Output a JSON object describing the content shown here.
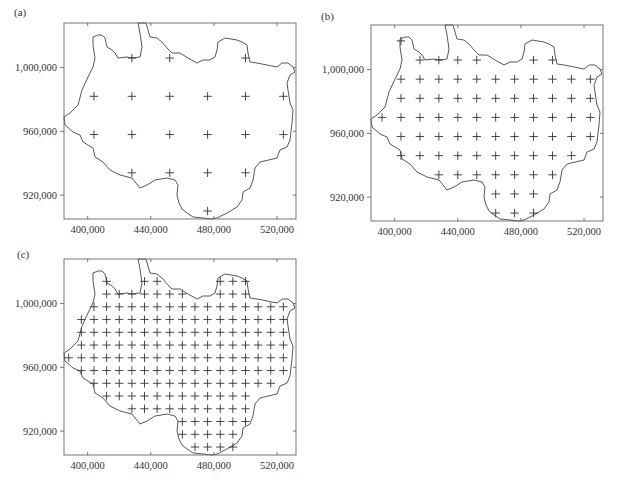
{
  "figure": {
    "panels": [
      {
        "id": "a",
        "label": "(a)"
      },
      {
        "id": "b",
        "label": "(b)"
      },
      {
        "id": "c",
        "label": "(c)"
      }
    ]
  },
  "chart_data": [
    {
      "type": "scatter",
      "title": "(a)",
      "xlabel": "",
      "ylabel": "",
      "xlim": [
        385000,
        532000
      ],
      "ylim": [
        905000,
        1028000
      ],
      "x_ticks": [
        400000,
        440000,
        480000,
        520000
      ],
      "x_tick_labels": [
        "400,000",
        "440,000",
        "480,000",
        "520,000"
      ],
      "y_ticks": [
        920000,
        960000,
        1000000
      ],
      "y_tick_labels": [
        "920,000",
        "960,000",
        "1,000,000"
      ],
      "grid": false,
      "marker": "+",
      "grid_spacing": 24000,
      "columns_x": [
        404000,
        428000,
        452000,
        476000,
        500000,
        524000
      ],
      "rows_y": [
        1006000,
        982000,
        958000,
        934000,
        910000
      ],
      "rows": [
        [
          1,
          2,
          4
        ],
        [
          0,
          1,
          2,
          3,
          4,
          5
        ],
        [
          0,
          1,
          2,
          3,
          4,
          5
        ],
        [
          1,
          2,
          3,
          4
        ],
        [
          3
        ]
      ],
      "point_count": 20
    },
    {
      "type": "scatter",
      "title": "(b)",
      "xlabel": "",
      "ylabel": "",
      "xlim": [
        385000,
        532000
      ],
      "ylim": [
        905000,
        1028000
      ],
      "x_ticks": [
        400000,
        440000,
        480000,
        520000
      ],
      "x_tick_labels": [
        "400,000",
        "440,000",
        "480,000",
        "520,000"
      ],
      "y_ticks": [
        920000,
        960000,
        1000000
      ],
      "y_tick_labels": [
        "920,000",
        "960,000",
        "1,000,000"
      ],
      "grid": false,
      "marker": "+",
      "grid_spacing": 12000,
      "columns_x": [
        392000,
        404000,
        416000,
        428000,
        440000,
        452000,
        464000,
        476000,
        488000,
        500000,
        512000,
        524000
      ],
      "rows_y": [
        1018000,
        1006000,
        994000,
        982000,
        970000,
        958000,
        946000,
        934000,
        922000,
        910000
      ],
      "rows": [
        [
          1
        ],
        [
          2,
          3,
          4,
          5,
          8,
          9
        ],
        [
          1,
          2,
          3,
          4,
          5,
          6,
          7,
          8,
          9,
          10,
          11
        ],
        [
          1,
          2,
          3,
          4,
          5,
          6,
          7,
          8,
          9,
          10,
          11
        ],
        [
          0,
          1,
          2,
          3,
          4,
          5,
          6,
          7,
          8,
          9,
          10,
          11
        ],
        [
          1,
          2,
          3,
          4,
          5,
          6,
          7,
          8,
          9,
          10,
          11
        ],
        [
          1,
          2,
          3,
          4,
          5,
          6,
          7,
          8,
          9,
          10
        ],
        [
          3,
          4,
          5,
          6,
          7,
          8,
          9
        ],
        [
          6,
          7,
          8
        ],
        [
          6,
          7,
          8
        ]
      ],
      "point_count": 83
    },
    {
      "type": "scatter",
      "title": "(c)",
      "xlabel": "",
      "ylabel": "",
      "xlim": [
        385000,
        532000
      ],
      "ylim": [
        905000,
        1028000
      ],
      "x_ticks": [
        400000,
        440000,
        480000,
        520000
      ],
      "x_tick_labels": [
        "400,000",
        "440,000",
        "480,000",
        "520,000"
      ],
      "y_ticks": [
        920000,
        960000,
        1000000
      ],
      "y_tick_labels": [
        "920,000",
        "960,000",
        "1,000,000"
      ],
      "grid": false,
      "marker": "+",
      "grid_spacing": 8000,
      "columns_x": [
        388000,
        396000,
        404000,
        412000,
        420000,
        428000,
        436000,
        444000,
        452000,
        460000,
        468000,
        476000,
        484000,
        492000,
        500000,
        508000,
        516000,
        524000
      ],
      "rows_y": [
        1014000,
        1006000,
        998000,
        990000,
        982000,
        974000,
        966000,
        958000,
        950000,
        942000,
        934000,
        926000,
        918000,
        910000
      ],
      "rows": [
        [
          3,
          6,
          7,
          12,
          13,
          14
        ],
        [
          3,
          4,
          5,
          6,
          7,
          8,
          9,
          12,
          13,
          14
        ],
        [
          2,
          3,
          4,
          5,
          6,
          7,
          8,
          9,
          10,
          11,
          12,
          13,
          14,
          15,
          16,
          17
        ],
        [
          1,
          2,
          3,
          4,
          5,
          6,
          7,
          8,
          9,
          10,
          11,
          12,
          13,
          14,
          15,
          16,
          17
        ],
        [
          1,
          2,
          3,
          4,
          5,
          6,
          7,
          8,
          9,
          10,
          11,
          12,
          13,
          14,
          15,
          16,
          17
        ],
        [
          1,
          2,
          3,
          4,
          5,
          6,
          7,
          8,
          9,
          10,
          11,
          12,
          13,
          14,
          15,
          16,
          17
        ],
        [
          0,
          1,
          2,
          3,
          4,
          5,
          6,
          7,
          8,
          9,
          10,
          11,
          12,
          13,
          14,
          15,
          16,
          17
        ],
        [
          1,
          2,
          3,
          4,
          5,
          6,
          7,
          8,
          9,
          10,
          11,
          12,
          13,
          14,
          15,
          16,
          17
        ],
        [
          2,
          3,
          4,
          5,
          6,
          7,
          8,
          9,
          10,
          11,
          12,
          13,
          14,
          15,
          16
        ],
        [
          3,
          4,
          5,
          6,
          7,
          8,
          9,
          10,
          11,
          12,
          13,
          14
        ],
        [
          5,
          6,
          7,
          8,
          9,
          10,
          11,
          12,
          13,
          14
        ],
        [
          9,
          10,
          11,
          12,
          13,
          14
        ],
        [
          9,
          10,
          11,
          12,
          13
        ],
        [
          10,
          11,
          12,
          13
        ]
      ],
      "point_count": 192
    }
  ],
  "boundary_outline_px": [
    [
      0,
      94
    ],
    [
      6,
      90
    ],
    [
      14,
      82
    ],
    [
      18,
      67
    ],
    [
      24,
      54
    ],
    [
      29,
      44
    ],
    [
      31,
      35
    ],
    [
      29,
      22
    ],
    [
      29,
      14
    ],
    [
      34,
      12
    ],
    [
      38,
      12
    ],
    [
      41,
      15
    ],
    [
      43,
      24
    ],
    [
      48,
      27
    ],
    [
      51,
      30
    ],
    [
      54,
      35
    ],
    [
      63,
      34
    ],
    [
      68,
      35
    ],
    [
      76,
      34
    ],
    [
      78,
      24
    ],
    [
      76,
      10
    ],
    [
      74,
      0
    ],
    [
      82,
      0
    ],
    [
      84,
      7
    ],
    [
      86,
      14
    ],
    [
      93,
      15
    ],
    [
      99,
      20
    ],
    [
      103,
      25
    ],
    [
      108,
      30
    ],
    [
      114,
      30
    ],
    [
      116,
      30
    ],
    [
      124,
      35
    ],
    [
      133,
      40
    ],
    [
      139,
      37
    ],
    [
      146,
      37
    ],
    [
      151,
      34
    ],
    [
      153,
      27
    ],
    [
      154,
      19
    ],
    [
      161,
      15
    ],
    [
      173,
      17
    ],
    [
      178,
      19
    ],
    [
      183,
      22
    ],
    [
      184,
      30
    ],
    [
      186,
      39
    ],
    [
      193,
      40
    ],
    [
      203,
      42
    ],
    [
      213,
      44
    ],
    [
      218,
      40
    ],
    [
      224,
      40
    ],
    [
      229,
      44
    ],
    [
      231,
      49
    ],
    [
      226,
      52
    ],
    [
      223,
      60
    ],
    [
      224,
      67
    ],
    [
      226,
      80
    ],
    [
      229,
      87
    ],
    [
      228,
      100
    ],
    [
      226,
      117
    ],
    [
      223,
      124
    ],
    [
      216,
      127
    ],
    [
      213,
      135
    ],
    [
      196,
      139
    ],
    [
      191,
      145
    ],
    [
      189,
      157
    ],
    [
      186,
      165
    ],
    [
      179,
      169
    ],
    [
      178,
      177
    ],
    [
      173,
      184
    ],
    [
      163,
      190
    ],
    [
      153,
      195
    ],
    [
      148,
      196
    ],
    [
      139,
      195
    ],
    [
      129,
      194
    ],
    [
      123,
      190
    ],
    [
      118,
      186
    ],
    [
      115,
      180
    ],
    [
      113,
      172
    ],
    [
      114,
      162
    ],
    [
      111,
      157
    ],
    [
      103,
      155
    ],
    [
      91,
      157
    ],
    [
      83,
      162
    ],
    [
      76,
      165
    ],
    [
      68,
      155
    ],
    [
      56,
      152
    ],
    [
      46,
      147
    ],
    [
      39,
      139
    ],
    [
      31,
      134
    ],
    [
      29,
      125
    ],
    [
      19,
      119
    ],
    [
      16,
      112
    ],
    [
      9,
      109
    ],
    [
      1,
      102
    ]
  ]
}
